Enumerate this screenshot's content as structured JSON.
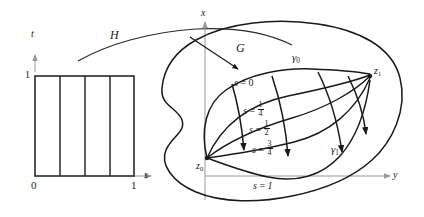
{
  "figure": {
    "stroke_color": "#1a1a1a",
    "axis_color": "#9a9a9a",
    "background": "#ffffff"
  },
  "square_panel": {
    "name": "unit-square-domain",
    "axes": {
      "vertical_label": "t",
      "horizontal_label": "s",
      "origin_label": "0",
      "top_tick_label": "1",
      "right_tick_label": "1"
    },
    "internal_divisions": 3,
    "strips": 4
  },
  "mapping": {
    "arrow_label": "H"
  },
  "region_panel": {
    "name": "region-G",
    "region_label": "G",
    "axes": {
      "vertical_label": "x",
      "horizontal_label": "y"
    },
    "endpoints": {
      "start": {
        "base": "z",
        "sub": "0"
      },
      "end": {
        "base": "z",
        "sub": "1"
      }
    },
    "path_labels": [
      {
        "base": "γ",
        "sub": "0"
      },
      {
        "base": "γ",
        "sub": "1"
      }
    ],
    "level_curves": [
      {
        "lhs": "s",
        "eq": "=",
        "value": "0",
        "is_fraction": false
      },
      {
        "lhs": "s",
        "eq": "=",
        "numerator": "1",
        "denominator": "4",
        "is_fraction": true
      },
      {
        "lhs": "s",
        "eq": "=",
        "numerator": "1",
        "denominator": "2",
        "is_fraction": true
      },
      {
        "lhs": "s",
        "eq": "=",
        "numerator": "3",
        "denominator": "4",
        "is_fraction": true
      },
      {
        "lhs": "s",
        "eq": "=",
        "value": "1",
        "is_fraction": false
      }
    ]
  }
}
